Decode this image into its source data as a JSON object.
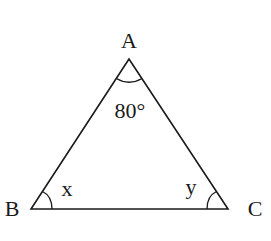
{
  "diagram": {
    "type": "triangle",
    "vertices": {
      "A": {
        "label": "A",
        "angle": "80°"
      },
      "B": {
        "label": "B",
        "angle": "x"
      },
      "C": {
        "label": "C",
        "angle": "y"
      }
    },
    "stroke_color": "#1a1a1a"
  }
}
